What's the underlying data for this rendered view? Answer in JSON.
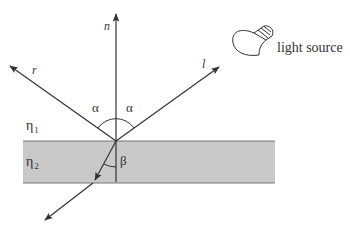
{
  "diagram": {
    "labels": {
      "normal": "n",
      "reflected": "r",
      "light_vector": "l",
      "incidence_angle_left": "α",
      "incidence_angle_right": "α",
      "refraction_angle": "β",
      "medium1": "η",
      "medium1_sub": "1",
      "medium2": "η",
      "medium2_sub": "2",
      "light_source": "light source"
    },
    "icons": {
      "light_source": "light-bulb-icon"
    },
    "colors": {
      "line": "#333333",
      "slab_fill": "#c9c9c9",
      "slab_edge": "#777777",
      "background": "#ffffff"
    }
  }
}
